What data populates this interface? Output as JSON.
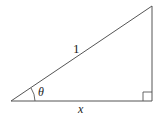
{
  "figure": {
    "type": "right-triangle",
    "colors": {
      "stroke": "#555555",
      "text": "#222222",
      "background": "#ffffff"
    },
    "vertices": {
      "angle_vertex": [
        11,
        101
      ],
      "top_vertex": [
        152,
        6
      ],
      "right_angle_vertex": [
        152,
        101
      ]
    },
    "labels": {
      "hypotenuse": "1",
      "angle": "θ",
      "adjacent_side": "x"
    },
    "right_angle_marker": true,
    "angle_arc": true
  }
}
